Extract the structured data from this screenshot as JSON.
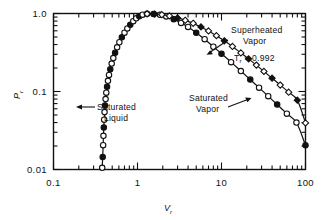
{
  "chart_data": {
    "type": "line",
    "title": "",
    "xlabel": "V_r",
    "ylabel": "P_r",
    "xscale": "log",
    "yscale": "log",
    "xlim": [
      0.1,
      100
    ],
    "ylim": [
      0.01,
      1.0
    ],
    "grid": false,
    "legend": "none",
    "xtick_labels": [
      "0.1",
      "1",
      "10",
      "100"
    ],
    "xtick_values": [
      0.1,
      1,
      10,
      100
    ],
    "ytick_labels": [
      "0.01",
      "0.1",
      "1.0"
    ],
    "ytick_values": [
      0.01,
      0.1,
      1.0
    ],
    "annotations": [
      {
        "id": "saturated-liquid",
        "text_line1": "Saturated",
        "text_line2": "Liquid"
      },
      {
        "id": "saturated-vapor",
        "text_line1": "Saturated",
        "text_line2": "Vapor"
      },
      {
        "id": "superheated-vapor",
        "text_line1": "Superheated",
        "text_line2": "Vapor"
      },
      {
        "id": "tr-value",
        "symbol": "T",
        "subscript": "r",
        "text": " = 0.992"
      }
    ],
    "series": [
      {
        "name": "saturation-dome",
        "marker": "circle-open",
        "points": [
          [
            0.38,
            0.0105
          ],
          [
            0.385,
            0.0145
          ],
          [
            0.39,
            0.0205
          ],
          [
            0.393,
            0.027
          ],
          [
            0.397,
            0.0345
          ],
          [
            0.401,
            0.0435
          ],
          [
            0.405,
            0.0545
          ],
          [
            0.41,
            0.066
          ],
          [
            0.417,
            0.08
          ],
          [
            0.425,
            0.0965
          ],
          [
            0.434,
            0.115
          ],
          [
            0.445,
            0.137
          ],
          [
            0.458,
            0.163
          ],
          [
            0.474,
            0.193
          ],
          [
            0.493,
            0.228
          ],
          [
            0.515,
            0.268
          ],
          [
            0.541,
            0.315
          ],
          [
            0.572,
            0.368
          ],
          [
            0.608,
            0.428
          ],
          [
            0.651,
            0.495
          ],
          [
            0.7,
            0.567
          ],
          [
            0.757,
            0.643
          ],
          [
            0.82,
            0.72
          ],
          [
            0.89,
            0.797
          ],
          [
            0.965,
            0.868
          ],
          [
            1.05,
            0.925
          ],
          [
            1.15,
            0.967
          ],
          [
            1.3,
            0.99
          ],
          [
            1.55,
            0.988
          ],
          [
            1.85,
            0.962
          ],
          [
            2.2,
            0.916
          ],
          [
            2.7,
            0.845
          ],
          [
            3.3,
            0.758
          ],
          [
            4.0,
            0.672
          ],
          [
            5.0,
            0.568
          ],
          [
            6.3,
            0.468
          ],
          [
            8.0,
            0.375
          ],
          [
            10.0,
            0.305
          ],
          [
            13.0,
            0.238
          ],
          [
            17.0,
            0.183
          ],
          [
            22.0,
            0.142
          ],
          [
            28.0,
            0.112
          ],
          [
            36.0,
            0.087
          ],
          [
            46.0,
            0.068
          ],
          [
            60.0,
            0.052
          ],
          [
            78.0,
            0.04
          ],
          [
            100.0,
            0.0205
          ]
        ]
      },
      {
        "name": "superheated-vapor-isotherm",
        "marker": "diamond-filled",
        "points": [
          [
            1.3,
            0.99
          ],
          [
            1.6,
            0.985
          ],
          [
            1.95,
            0.966
          ],
          [
            2.4,
            0.93
          ],
          [
            3.0,
            0.878
          ],
          [
            3.7,
            0.818
          ],
          [
            4.6,
            0.748
          ],
          [
            5.7,
            0.672
          ],
          [
            7.0,
            0.598
          ],
          [
            8.7,
            0.52
          ],
          [
            10.8,
            0.447
          ],
          [
            13.5,
            0.378
          ],
          [
            17.0,
            0.312
          ],
          [
            21.0,
            0.262
          ],
          [
            26.0,
            0.218
          ],
          [
            32.0,
            0.181
          ],
          [
            40.0,
            0.148
          ],
          [
            50.0,
            0.121
          ],
          [
            63.0,
            0.098
          ],
          [
            80.0,
            0.0775
          ],
          [
            100.0,
            0.0395
          ]
        ]
      }
    ]
  },
  "figure": {
    "background": "#ffffff",
    "ink": "#111111"
  }
}
